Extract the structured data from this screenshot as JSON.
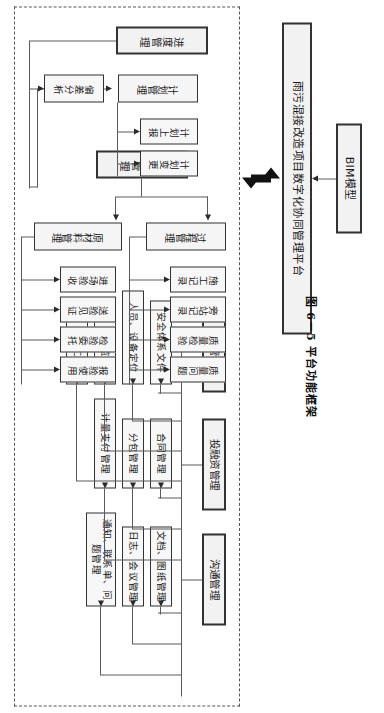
{
  "figure": {
    "caption": "图 6－5  平台功能框架",
    "bim_model": "BIM模型",
    "platform": "雨污混接改造项目数字化协同管理平台"
  },
  "modules": [
    {
      "key": "communication",
      "title": "沟通管理",
      "children": [
        {
          "label": "文档、图纸管理"
        },
        {
          "label": "日志、会议管理"
        },
        {
          "label": "通知、联系单、问题管理"
        }
      ]
    },
    {
      "key": "investment",
      "title": "投融资管理",
      "children": [
        {
          "label": "合同管理"
        },
        {
          "label": "分包管理"
        },
        {
          "label": "计量支付管理"
        }
      ]
    },
    {
      "key": "safety",
      "title": "安全管理",
      "children": [
        {
          "label": "安全体系文件"
        },
        {
          "label": "人员、设备定位"
        },
        {
          "label": "视频监控"
        },
        {
          "label": "平安工地"
        }
      ]
    },
    {
      "key": "quality",
      "title": "质量管理",
      "subgroups": [
        {
          "title": "过程管理",
          "children": [
            {
              "label": "施工记录"
            },
            {
              "label": "旁站记录"
            },
            {
              "label": "质量检验"
            },
            {
              "label": "质量问题"
            }
          ]
        },
        {
          "title": "原材料管理",
          "children": [
            {
              "label": "进场验收"
            },
            {
              "label": "送验见证"
            },
            {
              "label": "检验委托"
            },
            {
              "label": "报验使用"
            }
          ]
        }
      ]
    },
    {
      "key": "schedule",
      "title": "进度管理",
      "subgroups": [
        {
          "title": "计划管理",
          "children": [
            {
              "label": "计划上报"
            },
            {
              "label": "计划变更"
            }
          ]
        }
      ],
      "children": [
        {
          "label": "偏差分析"
        }
      ]
    }
  ],
  "colors": {
    "node_fill": "#f5f5f5",
    "node_border": "#333333",
    "line": "#5a5a5a",
    "frame": "#555555"
  }
}
